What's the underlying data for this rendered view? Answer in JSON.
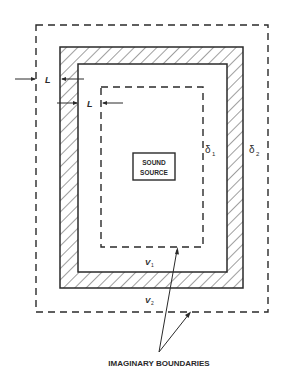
{
  "diagram": {
    "title": "",
    "labels": {
      "sound_source_line1": "SOUND",
      "sound_source_line2": "SOURCE",
      "delta1": "δ",
      "delta1_sub": "1",
      "delta2": "δ",
      "delta2_sub": "2",
      "v1": "V",
      "v1_sub": "1",
      "v2": "V",
      "v2_sub": "2",
      "dimension_outer": "L",
      "dimension_inner": "L",
      "caption": "IMAGINARY BOUNDARIES"
    },
    "elements": [
      {
        "id": "outer-imaginary-boundary",
        "style": "dashed",
        "label": "δ2"
      },
      {
        "id": "enclosure-wall",
        "style": "hatched"
      },
      {
        "id": "inner-imaginary-boundary",
        "style": "dashed",
        "label": "δ1"
      },
      {
        "id": "sound-source",
        "style": "box"
      }
    ],
    "colors": {
      "line": "#2a2a2a",
      "background": "#ffffff"
    }
  }
}
